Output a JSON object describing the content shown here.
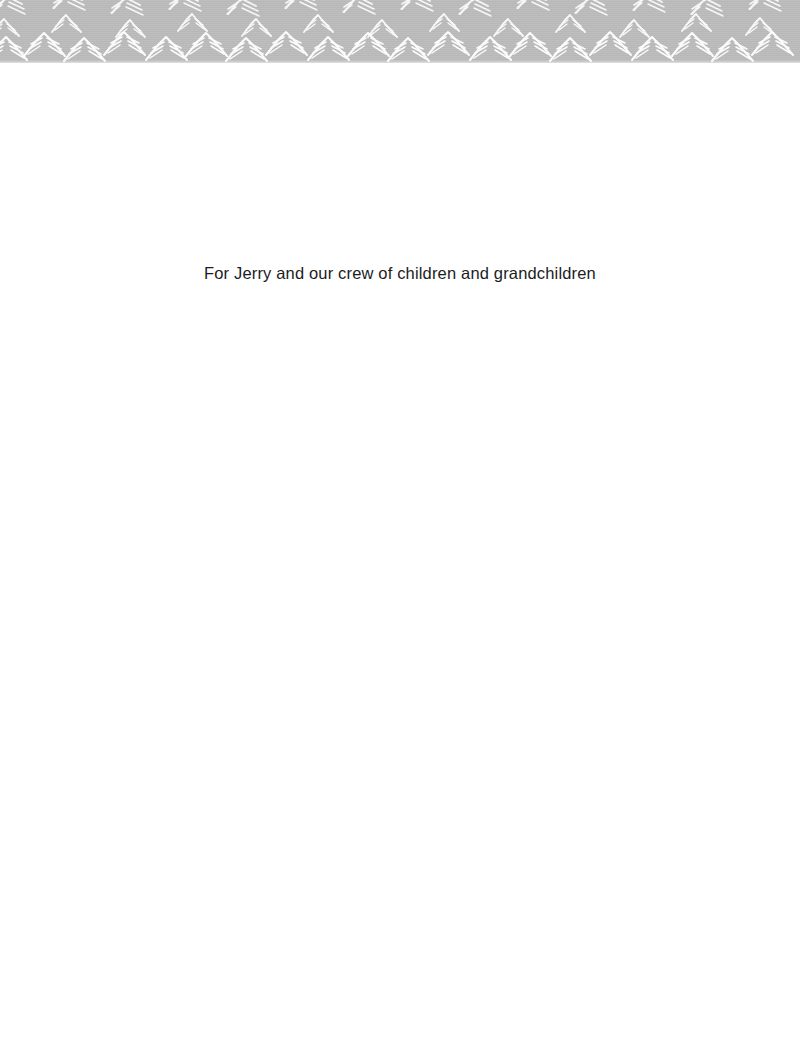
{
  "page": {
    "kind": "book-dedication-page",
    "background_color": "#ffffff",
    "width": 800,
    "height": 1061
  },
  "header": {
    "ornament_name": "mountain-peaks-band",
    "band_color": "#bcbcbc",
    "motif_color": "#ffffff",
    "band_height_px": 63
  },
  "dedication": {
    "text": "For Jerry and our crew of children and grandchildren",
    "color": "#1c1c1e",
    "alignment": "center"
  },
  "body": {
    "content": ""
  }
}
